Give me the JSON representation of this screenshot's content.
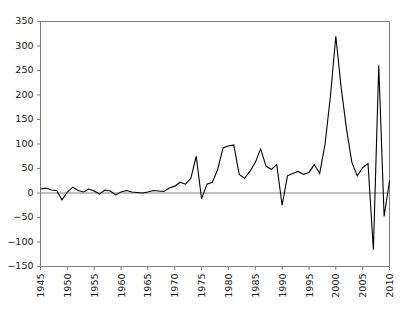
{
  "chart_data": {
    "type": "line",
    "title": "",
    "subtitle": "",
    "xlabel": "",
    "ylabel": "",
    "xlim": [
      1945,
      2010
    ],
    "ylim": [
      -150,
      350
    ],
    "grid": false,
    "legend_position": "none",
    "zero_line": true,
    "line_color": "#000000",
    "axis_color": "#808080",
    "xticks": [
      1945,
      1950,
      1955,
      1960,
      1965,
      1970,
      1975,
      1980,
      1985,
      1990,
      1995,
      2000,
      2005,
      2010
    ],
    "xtick_labels": [
      "1945",
      "1950",
      "1955",
      "1960",
      "1965",
      "1970",
      "1975",
      "1980",
      "1985",
      "1990",
      "1995",
      "2000",
      "2005",
      "2010"
    ],
    "yticks": [
      -150,
      -100,
      -50,
      0,
      50,
      100,
      150,
      200,
      250,
      300,
      350
    ],
    "ytick_labels": [
      "−150",
      "−100",
      "−50",
      "0",
      "50",
      "100",
      "150",
      "200",
      "250",
      "300",
      "350"
    ],
    "series": [
      {
        "name": "series-1",
        "x": [
          1945,
          1946,
          1947,
          1948,
          1949,
          1950,
          1951,
          1952,
          1953,
          1954,
          1955,
          1956,
          1957,
          1958,
          1959,
          1960,
          1961,
          1962,
          1963,
          1964,
          1965,
          1966,
          1967,
          1968,
          1969,
          1970,
          1971,
          1972,
          1973,
          1974,
          1975,
          1976,
          1977,
          1978,
          1979,
          1980,
          1981,
          1982,
          1983,
          1984,
          1985,
          1986,
          1987,
          1988,
          1989,
          1990,
          1991,
          1992,
          1993,
          1994,
          1995,
          1996,
          1997,
          1998,
          1999,
          2000,
          2001,
          2002,
          2003,
          2004,
          2005,
          2006,
          2007,
          2008,
          2009,
          2010
        ],
        "values": [
          8,
          10,
          6,
          5,
          -14,
          2,
          12,
          5,
          2,
          8,
          4,
          -2,
          6,
          4,
          -4,
          2,
          5,
          2,
          1,
          0,
          2,
          5,
          4,
          3,
          10,
          14,
          22,
          18,
          30,
          75,
          -12,
          18,
          22,
          48,
          92,
          96,
          98,
          38,
          30,
          44,
          62,
          90,
          55,
          48,
          58,
          -25,
          35,
          40,
          44,
          38,
          42,
          58,
          40,
          100,
          198,
          320,
          215,
          130,
          62,
          35,
          52,
          60,
          -116,
          260,
          -48,
          25
        ]
      }
    ]
  }
}
